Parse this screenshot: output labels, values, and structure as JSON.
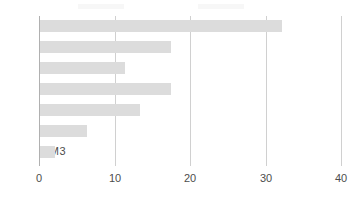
{
  "chart_data": {
    "type": "bar",
    "orientation": "horizontal",
    "title": "",
    "xlabel": "",
    "ylabel": "",
    "xlim": [
      0,
      41.6
    ],
    "ylim": [
      0,
      7
    ],
    "grid": true,
    "grid_axis": "x",
    "bar_color": "#dcdcdc",
    "axis_color": "#b0b0b0",
    "gridline_color": "#d0d0d0",
    "text_color": "#4d4d4d",
    "categories": [
      "S1",
      "S2",
      "S3",
      "S4",
      "M1",
      "M2",
      "M3"
    ],
    "values": [
      32.0,
      17.3,
      11.3,
      17.3,
      13.2,
      6.2,
      2.0
    ],
    "xticks": [
      0,
      10,
      20,
      30,
      40
    ],
    "xtick_labels": [
      "0",
      "10",
      "20",
      "30",
      "40"
    ],
    "legend_position": "top",
    "legend_clipped": true,
    "legend_entries": [
      {
        "label": "",
        "color": "#d9d9d9"
      },
      {
        "label": "",
        "color": "#d9d9d9"
      }
    ]
  }
}
